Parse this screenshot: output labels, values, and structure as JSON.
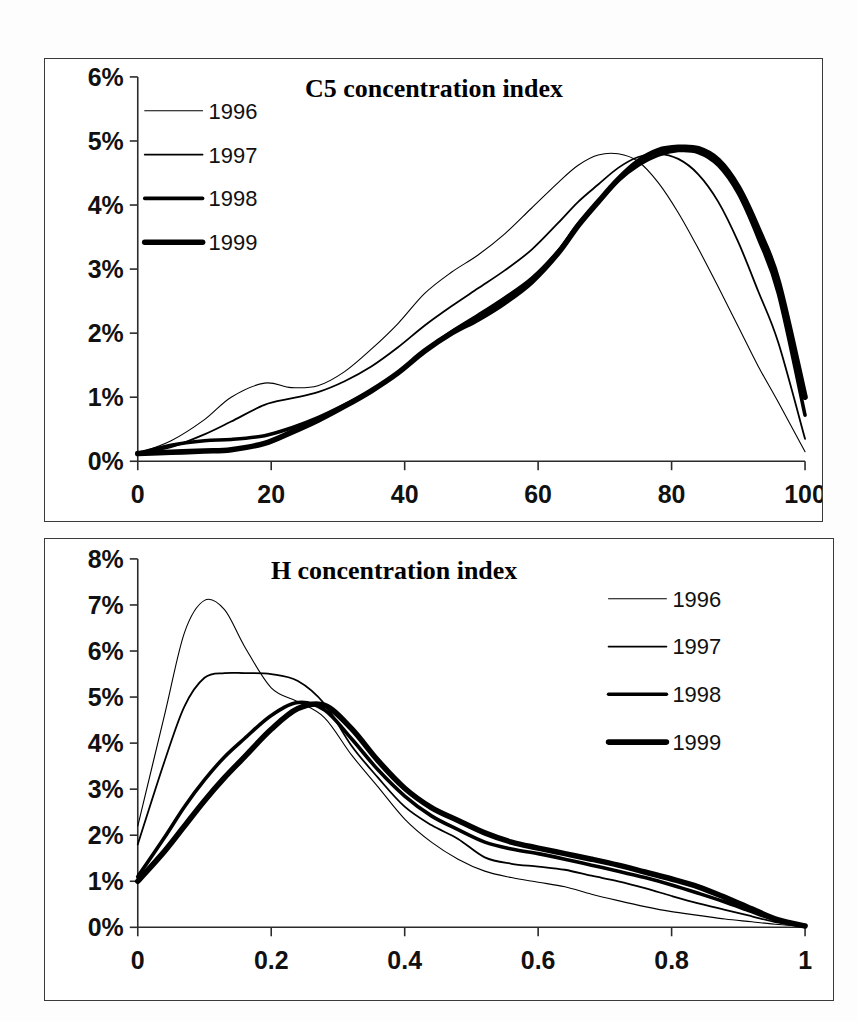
{
  "document": {
    "background_color": "#fdfdfd",
    "ink_color": "#000000"
  },
  "charts": [
    {
      "id": "c5",
      "title": "C5 concentration index",
      "legend_position": "top-left"
    },
    {
      "id": "h",
      "title": "H concentration index",
      "legend_position": "top-right"
    }
  ],
  "legend": {
    "items": [
      {
        "label": "1996",
        "stroke_width": 1.1
      },
      {
        "label": "1997",
        "stroke_width": 1.8
      },
      {
        "label": "1998",
        "stroke_width": 3.6
      },
      {
        "label": "1999",
        "stroke_width": 5.6
      }
    ]
  },
  "chart_data": [
    {
      "type": "line",
      "title": "C5 concentration index",
      "xlabel": "",
      "ylabel": "",
      "xlim": [
        0,
        100
      ],
      "ylim": [
        0,
        6
      ],
      "grid": false,
      "legend_position": "top-left",
      "x_ticks": [
        "0",
        "20",
        "40",
        "60",
        "80",
        "100"
      ],
      "x_tick_values": [
        0,
        20,
        40,
        60,
        80,
        100
      ],
      "y_ticks": [
        "0%",
        "1%",
        "2%",
        "3%",
        "4%",
        "5%",
        "6%"
      ],
      "y_tick_values": [
        0,
        1,
        2,
        3,
        4,
        5,
        6
      ],
      "x": [
        0,
        5,
        10,
        14,
        19,
        23,
        27,
        31,
        35,
        39,
        43,
        47,
        51,
        55,
        59,
        63,
        66,
        69,
        72,
        75,
        78,
        81,
        84,
        87,
        90,
        93,
        96,
        100
      ],
      "series": [
        {
          "name": "1996",
          "stroke_width": 1.1,
          "values": [
            0.12,
            0.32,
            0.65,
            1.0,
            1.22,
            1.15,
            1.18,
            1.4,
            1.75,
            2.15,
            2.62,
            2.95,
            3.22,
            3.55,
            3.95,
            4.35,
            4.62,
            4.78,
            4.8,
            4.68,
            4.35,
            3.88,
            3.32,
            2.72,
            2.1,
            1.48,
            0.92,
            0.15
          ]
        },
        {
          "name": "1997",
          "stroke_width": 1.8,
          "values": [
            0.12,
            0.22,
            0.42,
            0.62,
            0.88,
            0.98,
            1.08,
            1.25,
            1.48,
            1.78,
            2.12,
            2.42,
            2.7,
            2.98,
            3.3,
            3.72,
            4.05,
            4.32,
            4.58,
            4.75,
            4.8,
            4.72,
            4.48,
            4.05,
            3.42,
            2.65,
            1.85,
            0.35
          ]
        },
        {
          "name": "1998",
          "stroke_width": 3.6,
          "values": [
            0.12,
            0.25,
            0.32,
            0.34,
            0.4,
            0.52,
            0.68,
            0.88,
            1.1,
            1.38,
            1.72,
            2.02,
            2.28,
            2.55,
            2.85,
            3.28,
            3.7,
            4.05,
            4.38,
            4.62,
            4.78,
            4.85,
            4.82,
            4.62,
            4.18,
            3.48,
            2.62,
            0.72
          ]
        },
        {
          "name": "1999",
          "stroke_width": 5.6,
          "values": [
            0.12,
            0.14,
            0.16,
            0.18,
            0.28,
            0.45,
            0.64,
            0.86,
            1.1,
            1.38,
            1.72,
            2.0,
            2.22,
            2.48,
            2.8,
            3.25,
            3.68,
            4.05,
            4.4,
            4.68,
            4.85,
            4.9,
            4.88,
            4.7,
            4.28,
            3.62,
            2.8,
            1.0
          ]
        }
      ]
    },
    {
      "type": "line",
      "title": "H concentration index",
      "xlabel": "",
      "ylabel": "",
      "xlim": [
        0,
        1
      ],
      "ylim": [
        0,
        8
      ],
      "grid": false,
      "legend_position": "top-right",
      "x_ticks": [
        "0",
        "0.2",
        "0.4",
        "0.6",
        "0.8",
        "1"
      ],
      "x_tick_values": [
        0,
        0.2,
        0.4,
        0.6,
        0.8,
        1
      ],
      "y_ticks": [
        "0%",
        "1%",
        "2%",
        "3%",
        "4%",
        "5%",
        "6%",
        "7%",
        "8%"
      ],
      "y_tick_values": [
        0,
        1,
        2,
        3,
        4,
        5,
        6,
        7,
        8
      ],
      "x": [
        0,
        0.04,
        0.07,
        0.1,
        0.13,
        0.16,
        0.2,
        0.24,
        0.28,
        0.32,
        0.36,
        0.4,
        0.44,
        0.48,
        0.52,
        0.56,
        0.6,
        0.64,
        0.68,
        0.72,
        0.76,
        0.8,
        0.84,
        0.88,
        0.92,
        0.96,
        1.0
      ],
      "series": [
        {
          "name": "1996",
          "stroke_width": 1.1,
          "values": [
            2.2,
            4.6,
            6.4,
            7.1,
            6.9,
            6.1,
            5.2,
            4.9,
            4.55,
            3.75,
            3.05,
            2.35,
            1.85,
            1.48,
            1.22,
            1.08,
            0.98,
            0.88,
            0.72,
            0.58,
            0.45,
            0.34,
            0.26,
            0.18,
            0.12,
            0.06,
            0.02
          ]
        },
        {
          "name": "1997",
          "stroke_width": 1.8,
          "values": [
            1.8,
            3.6,
            4.8,
            5.42,
            5.52,
            5.52,
            5.5,
            5.35,
            4.85,
            3.95,
            3.25,
            2.62,
            2.22,
            1.92,
            1.52,
            1.38,
            1.32,
            1.25,
            1.12,
            1.0,
            0.85,
            0.68,
            0.52,
            0.38,
            0.24,
            0.1,
            0.02
          ]
        },
        {
          "name": "1998",
          "stroke_width": 3.6,
          "values": [
            1.1,
            1.95,
            2.62,
            3.2,
            3.7,
            4.1,
            4.6,
            4.88,
            4.72,
            4.1,
            3.42,
            2.85,
            2.42,
            2.12,
            1.85,
            1.7,
            1.6,
            1.48,
            1.35,
            1.22,
            1.08,
            0.92,
            0.74,
            0.55,
            0.34,
            0.14,
            0.03
          ]
        },
        {
          "name": "1999",
          "stroke_width": 5.6,
          "values": [
            1.0,
            1.65,
            2.2,
            2.75,
            3.25,
            3.7,
            4.3,
            4.75,
            4.82,
            4.32,
            3.62,
            3.02,
            2.6,
            2.32,
            2.05,
            1.85,
            1.72,
            1.6,
            1.48,
            1.35,
            1.2,
            1.05,
            0.88,
            0.65,
            0.4,
            0.16,
            0.03
          ]
        }
      ]
    }
  ]
}
